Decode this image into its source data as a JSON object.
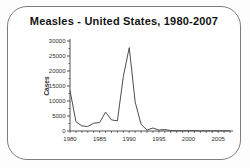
{
  "frame": {
    "border_color": "#7d7d7d",
    "background": "#ffffff"
  },
  "chart_data": {
    "type": "line",
    "title": "Measles - United States, 1980-2007",
    "xlabel": "",
    "ylabel": "Cases",
    "x": [
      1980,
      1981,
      1982,
      1983,
      1984,
      1985,
      1986,
      1987,
      1988,
      1989,
      1990,
      1991,
      1992,
      1993,
      1994,
      1995,
      1996,
      1997,
      1998,
      1999,
      2000,
      2001,
      2002,
      2003,
      2004,
      2005,
      2006,
      2007
    ],
    "values": [
      13500,
      3100,
      1700,
      1500,
      2600,
      2800,
      6300,
      3700,
      3400,
      18200,
      27800,
      9600,
      2200,
      300,
      1000,
      300,
      500,
      150,
      100,
      100,
      90,
      120,
      40,
      60,
      40,
      70,
      60,
      40
    ],
    "ylim": [
      0,
      30000
    ],
    "yticks": [
      0,
      5000,
      10000,
      15000,
      20000,
      25000,
      30000
    ],
    "ytick_minor_step": 2500,
    "xticks_labeled": [
      1980,
      1985,
      1990,
      1995,
      2000,
      2005
    ],
    "line_color": "#4d4d4d",
    "axis_color": "#3f3f3f",
    "grid": false,
    "legend": null
  }
}
